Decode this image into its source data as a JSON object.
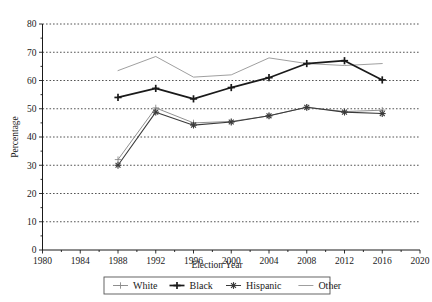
{
  "chart_data": {
    "type": "line",
    "title": "",
    "xlabel": "Election Year",
    "ylabel": "Percentage",
    "xlim": [
      1980,
      2020
    ],
    "ylim": [
      0,
      80
    ],
    "xticks": [
      1980,
      1984,
      1988,
      1992,
      1996,
      2000,
      2004,
      2008,
      2012,
      2016,
      2020
    ],
    "yticks": [
      0,
      10,
      20,
      30,
      40,
      50,
      60,
      70,
      80
    ],
    "grid": "horizontal-dotted",
    "legend_position": "bottom-center",
    "x": [
      1988,
      1992,
      1996,
      2000,
      2004,
      2008,
      2012,
      2016
    ],
    "series": [
      {
        "name": "White",
        "color": "#8a8a8a",
        "marker": "plus-thin",
        "values": [
          32.0,
          50.3,
          45.0,
          45.5,
          47.5,
          50.5,
          49.0,
          49.5
        ]
      },
      {
        "name": "Black",
        "color": "#1a1a1a",
        "marker": "plus-bold",
        "values": [
          54.0,
          57.2,
          53.5,
          57.5,
          61.0,
          66.0,
          67.0,
          60.2
        ]
      },
      {
        "name": "Hispanic",
        "color": "#3a3a3a",
        "marker": "star",
        "values": [
          30.0,
          48.8,
          44.2,
          45.3,
          47.5,
          50.5,
          48.8,
          48.3
        ]
      },
      {
        "name": "Other",
        "color": "#9a9a9a",
        "marker": "none",
        "values": [
          63.5,
          68.5,
          61.2,
          62.0,
          68.0,
          66.0,
          65.3,
          66.0
        ]
      }
    ]
  },
  "axis": {
    "ylabel": "Percentage",
    "xlabel": "Election Year",
    "ytick_labels": [
      "0",
      "10",
      "20",
      "30",
      "40",
      "50",
      "60",
      "70",
      "80"
    ],
    "xtick_labels": [
      "1980",
      "1984",
      "1988",
      "1992",
      "1996",
      "2000",
      "2004",
      "2008",
      "2012",
      "2016",
      "2020"
    ]
  },
  "legend": {
    "entries": [
      {
        "label": "White",
        "marker": "plus-thin",
        "color": "#8a8a8a"
      },
      {
        "label": "Black",
        "marker": "plus-bold",
        "color": "#1a1a1a"
      },
      {
        "label": "Hispanic",
        "marker": "star",
        "color": "#3a3a3a"
      },
      {
        "label": "Other",
        "marker": "none",
        "color": "#9a9a9a"
      }
    ]
  }
}
